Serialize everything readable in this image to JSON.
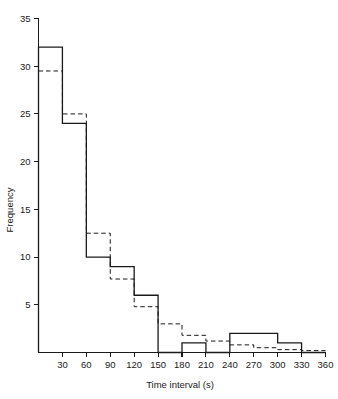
{
  "chart_data": {
    "type": "bar",
    "title": "",
    "subtitle": "",
    "xlabel": "Time interval  (s)",
    "ylabel": "Frequency",
    "grid": false,
    "legend": "none",
    "xlim": [
      0,
      360
    ],
    "ylim": [
      0,
      35
    ],
    "bin_width": 30,
    "categories": [
      "0-30",
      "30-60",
      "60-90",
      "90-120",
      "120-150",
      "150-180",
      "180-210",
      "210-240",
      "240-270",
      "270-300",
      "300-330",
      "330-360"
    ],
    "bin_edges": [
      0,
      30,
      60,
      90,
      120,
      150,
      180,
      210,
      240,
      270,
      300,
      330,
      360
    ],
    "xticks": [
      30,
      60,
      90,
      120,
      150,
      180,
      210,
      240,
      270,
      300,
      330,
      360
    ],
    "xtick_labels": [
      "30",
      "60",
      "90",
      "120",
      "150",
      "180",
      "210",
      "240",
      "270",
      "300",
      "330",
      "360"
    ],
    "yticks": [
      5,
      10,
      15,
      20,
      25,
      30,
      35
    ],
    "ytick_labels": [
      "5",
      "10",
      "15",
      "20",
      "25",
      "30",
      "35"
    ],
    "series": [
      {
        "name": "Observed frequency",
        "style": "solid-step-histogram",
        "values": [
          32,
          24,
          10,
          9,
          6,
          0,
          1,
          0,
          2,
          2,
          1,
          0
        ]
      },
      {
        "name": "Fitted exponential frequency",
        "style": "dashed-step",
        "values": [
          29.5,
          25,
          12.5,
          7.7,
          4.8,
          3.0,
          1.8,
          1.2,
          0.8,
          0.5,
          0.3,
          0.2
        ]
      }
    ]
  },
  "figure": {
    "background_color": "#ffffff",
    "ink_color": "#1a1a1a"
  }
}
